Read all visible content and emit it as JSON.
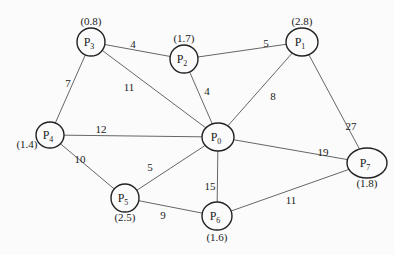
{
  "diagram": {
    "type": "weighted-undirected-graph",
    "nodes": [
      {
        "id": "P0",
        "base": "P",
        "sub": "0",
        "value": "",
        "x": 218,
        "y": 137,
        "rx": 16,
        "ry": 14
      },
      {
        "id": "P1",
        "base": "P",
        "sub": "1",
        "value": "(2.8)",
        "x": 302,
        "y": 42,
        "rx": 16,
        "ry": 14,
        "vx": 302,
        "vy": 25
      },
      {
        "id": "P2",
        "base": "P",
        "sub": "2",
        "value": "(1.7)",
        "x": 184,
        "y": 59,
        "rx": 14,
        "ry": 14,
        "vx": 184,
        "vy": 42
      },
      {
        "id": "P3",
        "base": "P",
        "sub": "3",
        "value": "(0.8)",
        "x": 91,
        "y": 42,
        "rx": 14,
        "ry": 14,
        "vx": 91,
        "vy": 25
      },
      {
        "id": "P4",
        "base": "P",
        "sub": "4",
        "value": "(1.4)",
        "x": 50,
        "y": 135,
        "rx": 14,
        "ry": 13,
        "vx": 27,
        "vy": 148
      },
      {
        "id": "P5",
        "base": "P",
        "sub": "5",
        "value": "(2.5)",
        "x": 125,
        "y": 198,
        "rx": 14,
        "ry": 14,
        "vx": 125,
        "vy": 221
      },
      {
        "id": "P6",
        "base": "P",
        "sub": "6",
        "value": "(1.6)",
        "x": 217,
        "y": 216,
        "rx": 15,
        "ry": 14,
        "vx": 217,
        "vy": 241
      },
      {
        "id": "P7",
        "base": "P",
        "sub": "7",
        "value": "(1.8)",
        "x": 367,
        "y": 163,
        "rx": 20,
        "ry": 15,
        "vx": 367,
        "vy": 187
      }
    ],
    "edges": [
      {
        "from": "P3",
        "to": "P2",
        "weight": "4",
        "lx": 133,
        "ly": 48
      },
      {
        "from": "P2",
        "to": "P1",
        "weight": "5",
        "lx": 266,
        "ly": 47
      },
      {
        "from": "P3",
        "to": "P4",
        "weight": "7",
        "lx": 68,
        "ly": 87
      },
      {
        "from": "P3",
        "to": "P0",
        "weight": "11",
        "lx": 129,
        "ly": 91
      },
      {
        "from": "P2",
        "to": "P0",
        "weight": "4",
        "lx": 207,
        "ly": 95
      },
      {
        "from": "P1",
        "to": "P0",
        "weight": "8",
        "lx": 273,
        "ly": 100
      },
      {
        "from": "P1",
        "to": "P7",
        "weight": "27",
        "lx": 351,
        "ly": 130
      },
      {
        "from": "P4",
        "to": "P0",
        "weight": "12",
        "lx": 101,
        "ly": 133
      },
      {
        "from": "P4",
        "to": "P5",
        "weight": "10",
        "lx": 80,
        "ly": 163
      },
      {
        "from": "P5",
        "to": "P0",
        "weight": "5",
        "lx": 150,
        "ly": 171
      },
      {
        "from": "P0",
        "to": "P7",
        "weight": "19",
        "lx": 323,
        "ly": 156
      },
      {
        "from": "P0",
        "to": "P6",
        "weight": "15",
        "lx": 210,
        "ly": 190
      },
      {
        "from": "P5",
        "to": "P6",
        "weight": "9",
        "lx": 163,
        "ly": 219
      },
      {
        "from": "P6",
        "to": "P7",
        "weight": "11",
        "lx": 291,
        "ly": 204
      }
    ]
  }
}
